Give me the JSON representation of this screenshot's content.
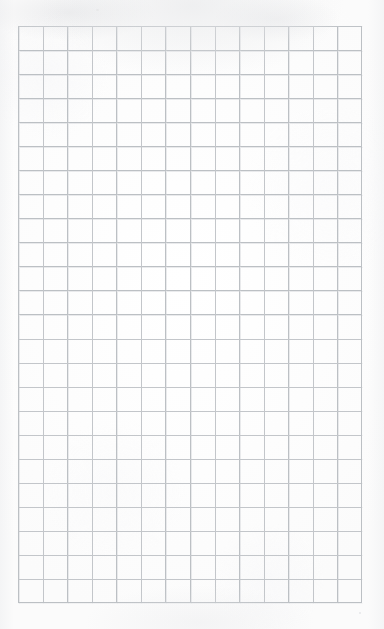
{
  "document": {
    "kind": "scanned-sheet",
    "title": "Blank grid paper",
    "page_width": 384,
    "page_height": 629,
    "has_text": false,
    "has_handwriting": false,
    "has_images": false,
    "notes": "Empty ruled graph-paper sheet; no printed or written content."
  },
  "colors": {
    "page_background": "#fdfdfd",
    "paper_edge_tint": "#eeeff1",
    "grid_line": "#bcc0c4",
    "grid_line_ghost": "#cdd0d4"
  },
  "grid": {
    "label": "graph-paper-ruling",
    "offset_x": 18,
    "offset_y": 26,
    "width": 344,
    "height": 577,
    "cell_width": 24.57,
    "cell_height": 24.04,
    "columns": 14,
    "rows": 24,
    "line_width": 1,
    "style": "uniform square grid, no emphasized major lines"
  },
  "margins": {
    "left": 18,
    "top": 26,
    "right": 22,
    "bottom": 26
  },
  "content": {
    "text_blocks": [],
    "annotations": []
  }
}
